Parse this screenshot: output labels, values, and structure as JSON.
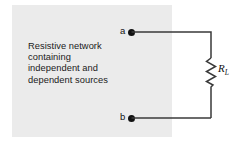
{
  "figure": {
    "type": "circuit-schematic",
    "network_box": {
      "text": "Resistive network\ncontaining\nindependent and\ndependent sources",
      "fill_color": "#ebebeb"
    },
    "terminals": [
      {
        "id": "a",
        "label": "a",
        "position": "top"
      },
      {
        "id": "b",
        "label": "b",
        "position": "bottom"
      }
    ],
    "components": [
      {
        "id": "load-resistor",
        "symbol": "resistor",
        "designator": "R",
        "subscript": "L",
        "orientation": "vertical"
      }
    ],
    "wire_color": "#3a3a3a",
    "ink_color": "#111111"
  }
}
